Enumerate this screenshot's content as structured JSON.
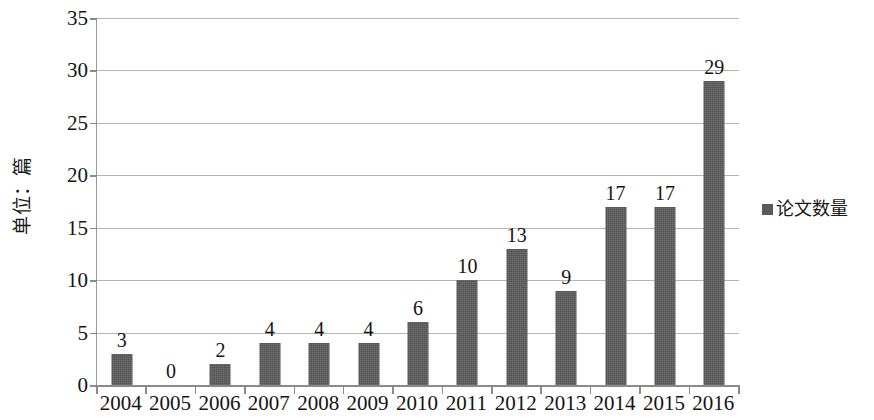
{
  "chart_data": {
    "type": "bar",
    "title": "",
    "subtitle": "",
    "xlabel": "",
    "ylabel": "单位：篇",
    "categories": [
      "2004",
      "2005",
      "2006",
      "2007",
      "2008",
      "2009",
      "2010",
      "2011",
      "2012",
      "2013",
      "2014",
      "2015",
      "2016"
    ],
    "values": [
      3,
      0,
      2,
      4,
      4,
      4,
      6,
      10,
      13,
      9,
      17,
      17,
      29
    ],
    "series": [
      {
        "name": "论文数量",
        "values": [
          3,
          0,
          2,
          4,
          4,
          4,
          6,
          10,
          13,
          9,
          17,
          17,
          29
        ],
        "color": "#5a5a5a"
      }
    ],
    "data_labels": [
      "3",
      "0",
      "2",
      "4",
      "4",
      "4",
      "6",
      "10",
      "13",
      "9",
      "17",
      "17",
      "29"
    ],
    "ylim": [
      0,
      35
    ],
    "ytick_step": 5,
    "ytick_labels": [
      "0",
      "5",
      "10",
      "15",
      "20",
      "25",
      "30",
      "35"
    ],
    "grid": true,
    "grid_axis": "y",
    "legend_position": "right",
    "legend_entries": [
      {
        "label": "论文数量",
        "marker": "square",
        "color": "#5a5a5a"
      }
    ]
  },
  "legend": {
    "marker_icon": "square-marker-icon",
    "label": "论文数量"
  },
  "axes": {
    "y_title": "单位：篇"
  },
  "colors": {
    "bar": "#5a5a5a",
    "gridline": "#b4b4b4",
    "axis": "#8a8a8a",
    "background": "#ffffff",
    "text": "#141414"
  }
}
